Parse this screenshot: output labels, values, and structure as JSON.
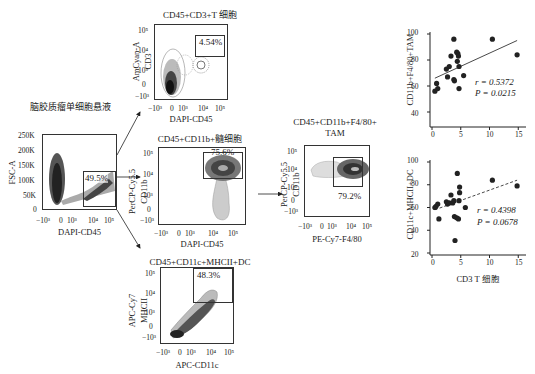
{
  "figure": {
    "source_label": "脑胶质瘤单细胞悬液",
    "panels": {
      "gating": {
        "ylabel": "FSC-A",
        "xlabel": "DAPI-CD45",
        "yticks": [
          "250K",
          "200K",
          "150K",
          "100K",
          "50K",
          "0"
        ],
        "xticks": [
          "−10³",
          "0",
          "10³",
          "10⁴",
          "10⁵"
        ],
        "gate_pct": "49.5%"
      },
      "tcell": {
        "title": "CD45+CD3+T 细胞",
        "ylabel_1": "AmCyan-A",
        "ylabel_2": "CD3",
        "xlabel": "DAPI-CD45",
        "yticks": [
          "10⁵",
          "10⁴",
          "10³",
          "0",
          "−10³"
        ],
        "xticks": [
          "−10³",
          "0",
          "10³",
          "10⁴",
          "10⁵"
        ],
        "gate_pct": "4.54%"
      },
      "myeloid": {
        "title": "CD45+CD11b+髓细胞",
        "ylabel_1": "PerCP-Cy5.5",
        "ylabel_2": "CD11b",
        "xlabel": "DAPI-CD45",
        "yticks": [
          "10⁵",
          "10⁴",
          "10³",
          "0",
          "−10³"
        ],
        "xticks": [
          "−10³",
          "0",
          "10³",
          "10⁴",
          "10⁵"
        ],
        "gate_pct": "75.6%"
      },
      "tam": {
        "title_1": "CD45+CD11b+F4/80+",
        "title_2": "TAM",
        "ylabel_1": "PerCP-Cy5.5",
        "ylabel_2": "CD11b",
        "xlabel": "PE-Cy7-F4/80",
        "yticks": [
          "10⁵",
          "10⁴",
          "10³",
          "0",
          "−10³"
        ],
        "xticks": [
          "−10³",
          "0",
          "10³",
          "10⁴",
          "10⁵"
        ],
        "gate_pct": "79.2%"
      },
      "dc": {
        "title": "CD45+CD11c+MHCII+DC",
        "ylabel_1": "APC-Cy7",
        "ylabel_2": "MHCII",
        "xlabel": "APC-CD11c",
        "yticks": [
          "10⁵",
          "10⁴",
          "10³",
          "0",
          "−10³"
        ],
        "xticks": [
          "−10³",
          "0",
          "10³",
          "10⁴",
          "10⁵"
        ],
        "gate_pct": "48.3%"
      }
    }
  },
  "chart_data": [
    {
      "type": "scatter",
      "title": "",
      "xlabel": "",
      "ylabel": "CD11b+F4/80+TAM",
      "xlim": [
        0,
        16
      ],
      "ylim": [
        30,
        100
      ],
      "xticks": [
        "0",
        "5",
        "10",
        "15"
      ],
      "yticks": [
        "100",
        "80",
        "60",
        "40"
      ],
      "points": [
        [
          0.5,
          56
        ],
        [
          0.8,
          62
        ],
        [
          1.0,
          58
        ],
        [
          2.5,
          73
        ],
        [
          2.7,
          67
        ],
        [
          3.0,
          75
        ],
        [
          3.3,
          83
        ],
        [
          3.8,
          96
        ],
        [
          3.8,
          65
        ],
        [
          3.9,
          64
        ],
        [
          4.3,
          86
        ],
        [
          4.4,
          79
        ],
        [
          4.5,
          85
        ],
        [
          4.6,
          83
        ],
        [
          4.7,
          75
        ],
        [
          4.7,
          58
        ],
        [
          5.5,
          68
        ],
        [
          10.5,
          96
        ],
        [
          14.8,
          84
        ]
      ],
      "fit": {
        "style": "solid",
        "x": [
          0.5,
          14.8
        ],
        "y": [
          66,
          95
        ]
      },
      "annotations": {
        "r": "r = 0.5372",
        "p": "P = 0.0215"
      }
    },
    {
      "type": "scatter",
      "title": "",
      "xlabel": "CD3 T 细胞",
      "ylabel": "CD11c+MHCII+DC",
      "xlim": [
        0,
        16
      ],
      "ylim": [
        20,
        100
      ],
      "xticks": [
        "0",
        "5",
        "10",
        "15"
      ],
      "yticks": [
        "100",
        "80",
        "60",
        "40",
        "20"
      ],
      "points": [
        [
          0.5,
          60
        ],
        [
          0.7,
          61
        ],
        [
          1.0,
          63
        ],
        [
          1.2,
          50
        ],
        [
          2.5,
          65
        ],
        [
          2.7,
          63
        ],
        [
          3.0,
          64
        ],
        [
          3.3,
          71
        ],
        [
          3.6,
          64
        ],
        [
          3.8,
          66
        ],
        [
          3.9,
          52
        ],
        [
          4.0,
          31
        ],
        [
          4.3,
          51
        ],
        [
          4.4,
          90
        ],
        [
          4.6,
          50
        ],
        [
          4.7,
          66
        ],
        [
          4.8,
          78
        ],
        [
          4.8,
          73
        ],
        [
          5.8,
          60
        ],
        [
          10.5,
          84
        ],
        [
          14.8,
          79
        ]
      ],
      "fit": {
        "style": "dashed",
        "x": [
          0.5,
          14.8
        ],
        "y": [
          58,
          84
        ]
      },
      "annotations": {
        "r": "r = 0.4398",
        "p": "P = 0.0678"
      }
    }
  ]
}
